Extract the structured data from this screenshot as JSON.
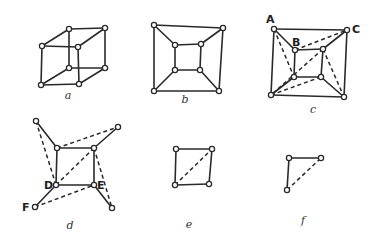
{
  "figures": [
    {
      "id": "a",
      "caption": "a",
      "caption_pos": [
        68,
        99
      ],
      "vertices": [
        [
          42,
          46
        ],
        [
          69,
          29
        ],
        [
          105,
          28
        ],
        [
          78,
          47
        ],
        [
          41,
          85
        ],
        [
          69,
          68
        ],
        [
          105,
          68
        ],
        [
          79,
          84
        ]
      ],
      "solid_edges": [
        [
          0,
          1
        ],
        [
          1,
          2
        ],
        [
          2,
          3
        ],
        [
          3,
          0
        ],
        [
          4,
          5
        ],
        [
          5,
          6
        ],
        [
          6,
          7
        ],
        [
          7,
          4
        ],
        [
          0,
          4
        ],
        [
          1,
          5
        ],
        [
          2,
          6
        ],
        [
          3,
          7
        ]
      ],
      "dashed_edges": [],
      "vertex_labels": []
    },
    {
      "id": "b",
      "caption": "b",
      "caption_pos": [
        185,
        103
      ],
      "vertices": [
        [
          154,
          25
        ],
        [
          223,
          28
        ],
        [
          219,
          91
        ],
        [
          154,
          91
        ],
        [
          175,
          45
        ],
        [
          201,
          44
        ],
        [
          200,
          70
        ],
        [
          175,
          70
        ]
      ],
      "solid_edges": [
        [
          0,
          1
        ],
        [
          1,
          2
        ],
        [
          2,
          3
        ],
        [
          3,
          0
        ],
        [
          4,
          5
        ],
        [
          5,
          6
        ],
        [
          6,
          7
        ],
        [
          7,
          4
        ],
        [
          0,
          4
        ],
        [
          1,
          5
        ],
        [
          2,
          6
        ],
        [
          3,
          7
        ]
      ],
      "dashed_edges": [],
      "vertex_labels": []
    },
    {
      "id": "c",
      "caption": "c",
      "caption_pos": [
        313,
        113
      ],
      "vertices": [
        [
          274,
          29
        ],
        [
          347,
          30
        ],
        [
          344,
          97
        ],
        [
          271,
          95
        ],
        [
          295,
          50
        ],
        [
          323,
          49
        ],
        [
          321,
          77
        ],
        [
          294,
          77
        ]
      ],
      "solid_edges": [
        [
          0,
          1
        ],
        [
          1,
          2
        ],
        [
          2,
          3
        ],
        [
          3,
          0
        ],
        [
          4,
          5
        ],
        [
          5,
          6
        ],
        [
          6,
          7
        ],
        [
          7,
          4
        ],
        [
          0,
          4
        ],
        [
          1,
          5
        ],
        [
          2,
          6
        ],
        [
          3,
          7
        ]
      ],
      "dashed_edges": [
        [
          0,
          7
        ],
        [
          4,
          1
        ],
        [
          5,
          3
        ],
        [
          3,
          6
        ],
        [
          5,
          2
        ]
      ],
      "vertex_labels": [
        {
          "text": "A",
          "pos": [
            266,
            23
          ]
        },
        {
          "text": "B",
          "pos": [
            292,
            46
          ]
        },
        {
          "text": "C",
          "pos": [
            352,
            33
          ]
        }
      ]
    },
    {
      "id": "d",
      "caption": "d",
      "caption_pos": [
        70,
        229
      ],
      "vertices": [
        [
          36,
          121
        ],
        [
          118,
          127
        ],
        [
          112,
          208
        ],
        [
          35,
          207
        ],
        [
          57,
          148
        ],
        [
          94,
          148
        ],
        [
          94,
          185
        ],
        [
          56,
          185
        ]
      ],
      "solid_edges": [
        [
          4,
          5
        ],
        [
          5,
          6
        ],
        [
          6,
          7
        ],
        [
          7,
          4
        ],
        [
          0,
          4
        ],
        [
          1,
          5
        ],
        [
          2,
          6
        ],
        [
          3,
          7
        ]
      ],
      "dashed_edges": [
        [
          0,
          7
        ],
        [
          4,
          1
        ],
        [
          5,
          7
        ],
        [
          3,
          6
        ],
        [
          5,
          2
        ]
      ],
      "vertex_labels": [
        {
          "text": "D",
          "pos": [
            44,
            189
          ]
        },
        {
          "text": "E",
          "pos": [
            97,
            189
          ]
        },
        {
          "text": "F",
          "pos": [
            22,
            211
          ]
        }
      ]
    },
    {
      "id": "e",
      "caption": "e",
      "caption_pos": [
        189,
        228
      ],
      "vertices": [
        [
          176,
          149
        ],
        [
          212,
          149
        ],
        [
          209,
          184
        ],
        [
          175,
          185
        ]
      ],
      "solid_edges": [
        [
          0,
          1
        ],
        [
          1,
          2
        ],
        [
          2,
          3
        ],
        [
          3,
          0
        ]
      ],
      "dashed_edges": [
        [
          3,
          1
        ]
      ],
      "vertex_labels": []
    },
    {
      "id": "f",
      "caption": "f",
      "caption_pos": [
        303,
        224
      ],
      "vertices": [
        [
          289,
          158
        ],
        [
          321,
          158
        ],
        [
          287,
          190
        ]
      ],
      "solid_edges": [
        [
          0,
          1
        ],
        [
          0,
          2
        ]
      ],
      "dashed_edges": [
        [
          2,
          1
        ]
      ],
      "vertex_labels": []
    }
  ],
  "colors": {
    "background": "#ffffff",
    "stroke": "#2a2a2a",
    "node_fill": "#ffffff"
  }
}
